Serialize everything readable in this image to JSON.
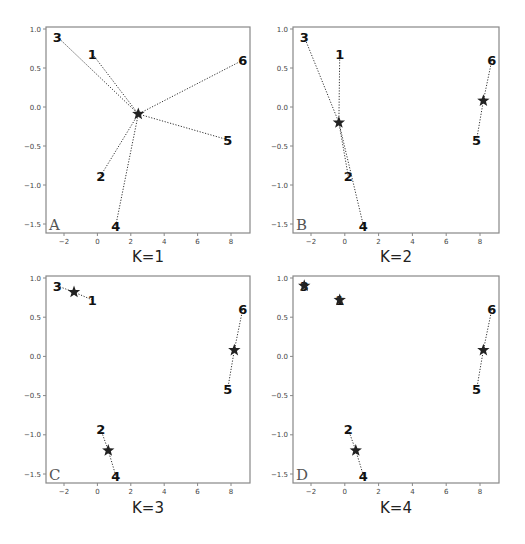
{
  "chart_data": [
    {
      "type": "scatter",
      "panel": "A",
      "title": "K=1",
      "xlabel": "K=1",
      "ylabel": "",
      "xlim": [
        -3,
        9.2
      ],
      "ylim": [
        -1.62,
        1.03
      ],
      "xticks": [
        -2,
        0,
        2,
        4,
        6,
        8
      ],
      "yticks": [
        -1.5,
        -1.0,
        -0.5,
        0.0,
        0.5,
        1.0
      ],
      "xtick_labels": [
        "−2",
        "0",
        "2",
        "4",
        "6",
        "8"
      ],
      "ytick_labels": [
        "−1.5",
        "−1.0",
        "−0.5",
        "0.0",
        "0.5",
        "1.0"
      ],
      "grid": false,
      "points": [
        {
          "label": "1",
          "x": -0.3,
          "y": 0.68
        },
        {
          "label": "2",
          "x": 0.2,
          "y": -0.88
        },
        {
          "label": "3",
          "x": -2.4,
          "y": 0.9
        },
        {
          "label": "4",
          "x": 1.1,
          "y": -1.52
        },
        {
          "label": "5",
          "x": 7.8,
          "y": -0.42
        },
        {
          "label": "6",
          "x": 8.7,
          "y": 0.6
        }
      ],
      "centroids": [
        {
          "x": 2.45,
          "y": -0.09,
          "members": [
            "1",
            "2",
            "3",
            "4",
            "5",
            "6"
          ]
        }
      ]
    },
    {
      "type": "scatter",
      "panel": "B",
      "title": "K=2",
      "xlabel": "K=2",
      "ylabel": "",
      "xlim": [
        -3,
        9.2
      ],
      "ylim": [
        -1.62,
        1.03
      ],
      "xticks": [
        -2,
        0,
        2,
        4,
        6,
        8
      ],
      "yticks": [
        -1.5,
        -1.0,
        -0.5,
        0.0,
        0.5,
        1.0
      ],
      "xtick_labels": [
        "−2",
        "0",
        "2",
        "4",
        "6",
        "8"
      ],
      "ytick_labels": [
        "−1.5",
        "−1.0",
        "−0.5",
        "0.0",
        "0.5",
        "1.0"
      ],
      "grid": false,
      "points": [
        {
          "label": "1",
          "x": -0.3,
          "y": 0.68
        },
        {
          "label": "2",
          "x": 0.2,
          "y": -0.88
        },
        {
          "label": "3",
          "x": -2.4,
          "y": 0.9
        },
        {
          "label": "4",
          "x": 1.1,
          "y": -1.52
        },
        {
          "label": "5",
          "x": 7.8,
          "y": -0.42
        },
        {
          "label": "6",
          "x": 8.7,
          "y": 0.6
        }
      ],
      "centroids": [
        {
          "x": -0.35,
          "y": -0.2,
          "members": [
            "1",
            "2",
            "3",
            "4"
          ]
        },
        {
          "x": 8.2,
          "y": 0.08,
          "members": [
            "5",
            "6"
          ]
        }
      ]
    },
    {
      "type": "scatter",
      "panel": "C",
      "title": "K=3",
      "xlabel": "K=3",
      "ylabel": "",
      "xlim": [
        -3,
        9.2
      ],
      "ylim": [
        -1.62,
        1.03
      ],
      "xticks": [
        -2,
        0,
        2,
        4,
        6,
        8
      ],
      "yticks": [
        -1.5,
        -1.0,
        -0.5,
        0.0,
        0.5,
        1.0
      ],
      "xtick_labels": [
        "−2",
        "0",
        "2",
        "4",
        "6",
        "8"
      ],
      "ytick_labels": [
        "−1.5",
        "−1.0",
        "−0.5",
        "0.0",
        "0.5",
        "1.0"
      ],
      "grid": false,
      "points": [
        {
          "label": "1",
          "x": -0.3,
          "y": 0.72
        },
        {
          "label": "2",
          "x": 0.2,
          "y": -0.93
        },
        {
          "label": "3",
          "x": -2.4,
          "y": 0.9
        },
        {
          "label": "4",
          "x": 1.1,
          "y": -1.52
        },
        {
          "label": "5",
          "x": 7.8,
          "y": -0.42
        },
        {
          "label": "6",
          "x": 8.7,
          "y": 0.6
        }
      ],
      "centroids": [
        {
          "x": -1.4,
          "y": 0.82,
          "members": [
            "3",
            "1"
          ]
        },
        {
          "x": 0.65,
          "y": -1.2,
          "members": [
            "2",
            "4"
          ]
        },
        {
          "x": 8.2,
          "y": 0.08,
          "members": [
            "5",
            "6"
          ]
        }
      ]
    },
    {
      "type": "scatter",
      "panel": "D",
      "title": "K=4",
      "xlabel": "K=4",
      "ylabel": "",
      "xlim": [
        -3,
        9.2
      ],
      "ylim": [
        -1.62,
        1.03
      ],
      "xticks": [
        -2,
        0,
        2,
        4,
        6,
        8
      ],
      "yticks": [
        -1.5,
        -1.0,
        -0.5,
        0.0,
        0.5,
        1.0
      ],
      "xtick_labels": [
        "−2",
        "0",
        "2",
        "4",
        "6",
        "8"
      ],
      "ytick_labels": [
        "−1.5",
        "−1.0",
        "−0.5",
        "0.0",
        "0.5",
        "1.0"
      ],
      "grid": false,
      "points": [
        {
          "label": "1",
          "x": -0.3,
          "y": 0.72
        },
        {
          "label": "2",
          "x": 0.2,
          "y": -0.93
        },
        {
          "label": "3",
          "x": -2.4,
          "y": 0.9
        },
        {
          "label": "4",
          "x": 1.1,
          "y": -1.52
        },
        {
          "label": "5",
          "x": 7.8,
          "y": -0.42
        },
        {
          "label": "6",
          "x": 8.7,
          "y": 0.6
        }
      ],
      "centroids": [
        {
          "x": -2.4,
          "y": 0.9,
          "members": [
            "3"
          ]
        },
        {
          "x": -0.3,
          "y": 0.72,
          "members": [
            "1"
          ]
        },
        {
          "x": 0.65,
          "y": -1.2,
          "members": [
            "2",
            "4"
          ]
        },
        {
          "x": 8.2,
          "y": 0.08,
          "members": [
            "5",
            "6"
          ]
        }
      ]
    }
  ],
  "panels": [
    {
      "letter": "A",
      "k_label": "K=1"
    },
    {
      "letter": "B",
      "k_label": "K=2"
    },
    {
      "letter": "C",
      "k_label": "K=3"
    },
    {
      "letter": "D",
      "k_label": "K=4"
    }
  ],
  "colors": {
    "frame": "#888888",
    "point_label": "#111111",
    "centroid": "#222222",
    "connector": "#333333",
    "panel_letter": "#555555",
    "tick_label": "#444444"
  }
}
